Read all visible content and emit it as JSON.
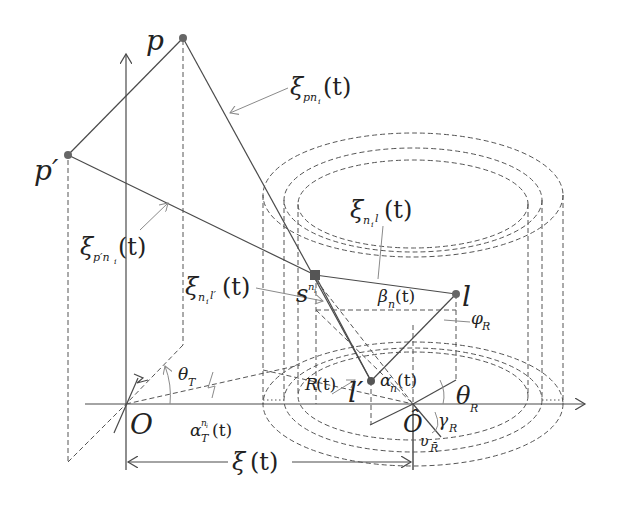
{
  "diagram": {
    "type": "geometric-schematic",
    "colors": {
      "line": "#4a4a4a",
      "leader": "#8a8a8a",
      "text": "#222222",
      "background": "#ffffff"
    },
    "points": {
      "p": {
        "label": "p",
        "x": 183,
        "y": 38
      },
      "p_prime": {
        "label": "p′",
        "x": 68,
        "y": 155
      },
      "s": {
        "label": "s",
        "sup": "n",
        "supsub": "i",
        "x": 315,
        "y": 275
      },
      "l": {
        "label": "l",
        "x": 456,
        "y": 294
      },
      "l_prime": {
        "label": "l′",
        "x": 371,
        "y": 381
      },
      "origin": {
        "label": "O",
        "x": 126,
        "y": 404
      },
      "origin_hat": {
        "label": "Ô",
        "x": 413,
        "y": 404
      }
    },
    "labels": {
      "xi_pn": {
        "sym": "ξ",
        "sub": "pn",
        "subsub": "i",
        "arg": "(t)"
      },
      "xi_ppn": {
        "sym": "ξ",
        "sub": "p′n",
        "subsub": "i",
        "arg": "(t)"
      },
      "xi_nl": {
        "sym": "ξ",
        "sub": "n",
        "subsub": "i",
        "sub2": "l",
        "arg": "(t)"
      },
      "xi_nlp": {
        "sym": "ξ",
        "sub": "n",
        "subsub": "i",
        "sub2": "l′",
        "arg": "(t)"
      },
      "xi_t": {
        "sym": "ξ",
        "arg": "(t)"
      },
      "theta_T": {
        "sym": "θ",
        "sub": "T"
      },
      "alpha_T": {
        "sym": "α",
        "sub": "T",
        "sup": "n",
        "supsub": "i",
        "arg": "(t)"
      },
      "beta_n": {
        "sym": "β",
        "sub": "n",
        "arg": "(t)"
      },
      "alpha_n": {
        "sym": "α",
        "sub": "n",
        "arg": "(t)"
      },
      "phi_R": {
        "sym": "φ",
        "sub": "R"
      },
      "theta_R": {
        "sym": "θ",
        "sub": "R"
      },
      "gamma_R": {
        "sym": "γ",
        "sub": "R"
      },
      "upsilon_R": {
        "sym": "υ",
        "sub": "R̄"
      },
      "R_t": {
        "sym": "R",
        "arg": "(t)"
      }
    }
  }
}
